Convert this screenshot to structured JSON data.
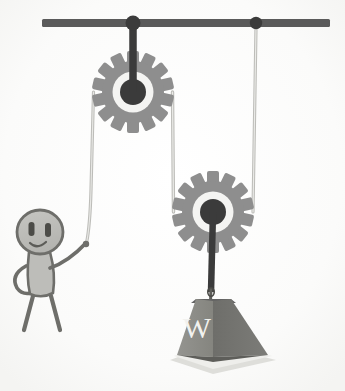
{
  "illustration": {
    "title": "Compound pulley system with stick figure",
    "subject": "physics-mechanics-diagram",
    "background_color": "#ffffff"
  },
  "support": {
    "name": "ceiling-beam",
    "color": "#5a5a5a",
    "x_start": 42,
    "x_end": 330,
    "y": 23,
    "thickness": 8
  },
  "anchors": [
    {
      "name": "anchor-left",
      "label": "",
      "x": 133,
      "y": 23,
      "radius": 7,
      "color": "#3b3b3b"
    },
    {
      "name": "anchor-right",
      "label": "",
      "x": 256,
      "y": 23,
      "radius": 6,
      "color": "#3b3b3b"
    }
  ],
  "pulleys": [
    {
      "name": "fixed-pulley",
      "role": "fixed",
      "cx": 133,
      "cy": 92,
      "outer_radius": 40,
      "body_radius": 30,
      "ring_radius": 20,
      "hub_radius": 13,
      "teeth": 14,
      "gear_color": "#8e8e8e",
      "ring_color": "#f4f4f2",
      "hub_color": "#3b3b3b"
    },
    {
      "name": "movable-pulley",
      "role": "movable",
      "cx": 213,
      "cy": 212,
      "outer_radius": 40,
      "body_radius": 30,
      "ring_radius": 20,
      "hub_radius": 13,
      "teeth": 14,
      "gear_color": "#8e8e8e",
      "ring_color": "#f4f4f2",
      "hub_color": "#3b3b3b"
    }
  ],
  "ropes": [
    {
      "name": "rope-pull-segment",
      "from": "hand",
      "to": "fixed-pulley-left",
      "color": "#b8b8b4"
    },
    {
      "name": "rope-middle-segment",
      "from": "fixed-pulley-right",
      "to": "movable-pulley-left",
      "color": "#b8b8b4"
    },
    {
      "name": "rope-anchor-segment",
      "from": "anchor-right",
      "to": "movable-pulley-right",
      "color": "#b8b8b4"
    }
  ],
  "hanger": {
    "name": "weight-hanger-rod",
    "color": "#3b3b3b",
    "from_y": 212,
    "to_y": 300
  },
  "weight": {
    "name": "hanging-weight",
    "label": "W",
    "shape": "truncated-pyramid",
    "top_left_x": 196,
    "top_right_x": 231,
    "bottom_left_x": 177,
    "bottom_right_x": 268,
    "top_y": 298,
    "bottom_y": 355,
    "face_left_color": "#8e8e8e",
    "face_right_color": "#707070",
    "top_face_color": "#636363",
    "label_color": "#f2f2ef",
    "shadow_color": "#d8d8d4"
  },
  "figure": {
    "name": "stick-figure-person",
    "head": {
      "cx": 40,
      "cy": 232,
      "rx": 23,
      "ry": 22
    },
    "fill_color": "#bdbdb9",
    "stroke_color": "#6e6e6a",
    "eyes": [
      {
        "name": "eye-left",
        "cx": 32,
        "cy": 229
      },
      {
        "name": "eye-right",
        "cx": 48,
        "cy": 230
      }
    ],
    "mouth": "smile",
    "arms": [
      "arm-raised-holding-rope",
      "arm-on-hip"
    ],
    "legs": [
      "leg-left",
      "leg-right"
    ],
    "hand_grip_point": {
      "x": 86,
      "y": 244
    }
  },
  "labels": {
    "weight_text": "W"
  }
}
